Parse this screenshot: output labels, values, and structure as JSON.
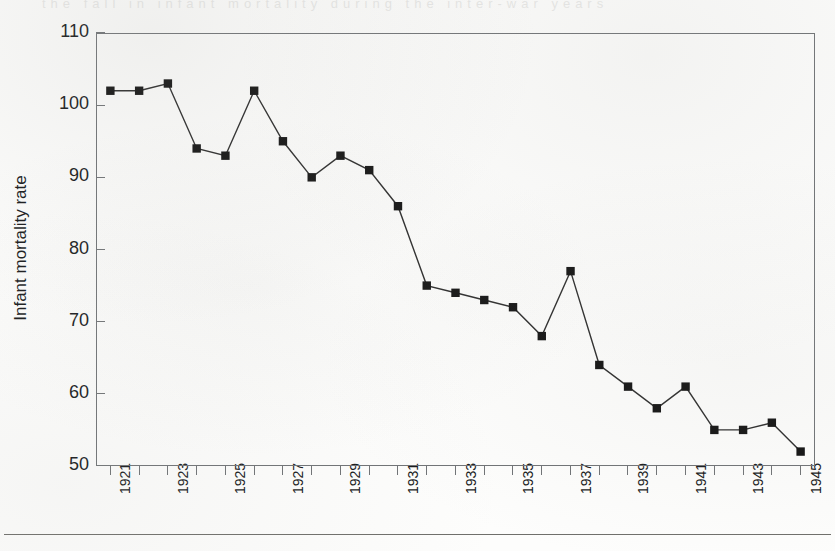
{
  "figure": {
    "background_color": "#fdfdfc",
    "ink_color": "#16181a",
    "axis_color": "#6f7275",
    "marker_color": "#101010",
    "line_color": "#2a2a2a",
    "ghost_text": "the  fall  in  infant  mortality  during  the  inter-war  years"
  },
  "chart_data": {
    "type": "line",
    "title": "",
    "subtitle": "",
    "xlabel": "",
    "ylabel": "Infant mortality rate",
    "ylim": [
      50,
      110
    ],
    "ytick_values": [
      50,
      60,
      70,
      80,
      90,
      100,
      110
    ],
    "ytick_labels": [
      "50",
      "60",
      "70",
      "80",
      "90",
      "100",
      "110"
    ],
    "xlim": [
      1920.5,
      1945.5
    ],
    "grid": false,
    "legend": "none",
    "marker": "square",
    "x": [
      1921,
      1922,
      1923,
      1924,
      1925,
      1926,
      1927,
      1928,
      1929,
      1930,
      1931,
      1932,
      1933,
      1934,
      1935,
      1936,
      1937,
      1938,
      1939,
      1940,
      1941,
      1942,
      1943,
      1944,
      1945
    ],
    "xtick_values": [
      1921,
      1922,
      1923,
      1924,
      1925,
      1926,
      1927,
      1928,
      1929,
      1930,
      1931,
      1932,
      1933,
      1934,
      1935,
      1936,
      1937,
      1938,
      1939,
      1940,
      1941,
      1942,
      1943,
      1944,
      1945
    ],
    "xtick_labels": [
      "1921",
      "",
      "1923",
      "",
      "1925",
      "",
      "1927",
      "",
      "1929",
      "",
      "1931",
      "",
      "1933",
      "",
      "1935",
      "",
      "1937",
      "",
      "1939",
      "",
      "1941",
      "",
      "1943",
      "",
      "1945"
    ],
    "values": [
      102,
      102,
      103,
      94,
      93,
      102,
      95,
      90,
      93,
      91,
      86,
      75,
      74,
      73,
      72,
      68,
      77,
      64,
      61,
      58,
      61,
      55,
      55,
      56,
      52
    ],
    "series": [
      {
        "name": "Infant mortality rate",
        "values": [
          102,
          102,
          103,
          94,
          93,
          102,
          95,
          90,
          93,
          91,
          86,
          75,
          74,
          73,
          72,
          68,
          77,
          64,
          61,
          58,
          61,
          55,
          55,
          56,
          52
        ]
      }
    ]
  }
}
